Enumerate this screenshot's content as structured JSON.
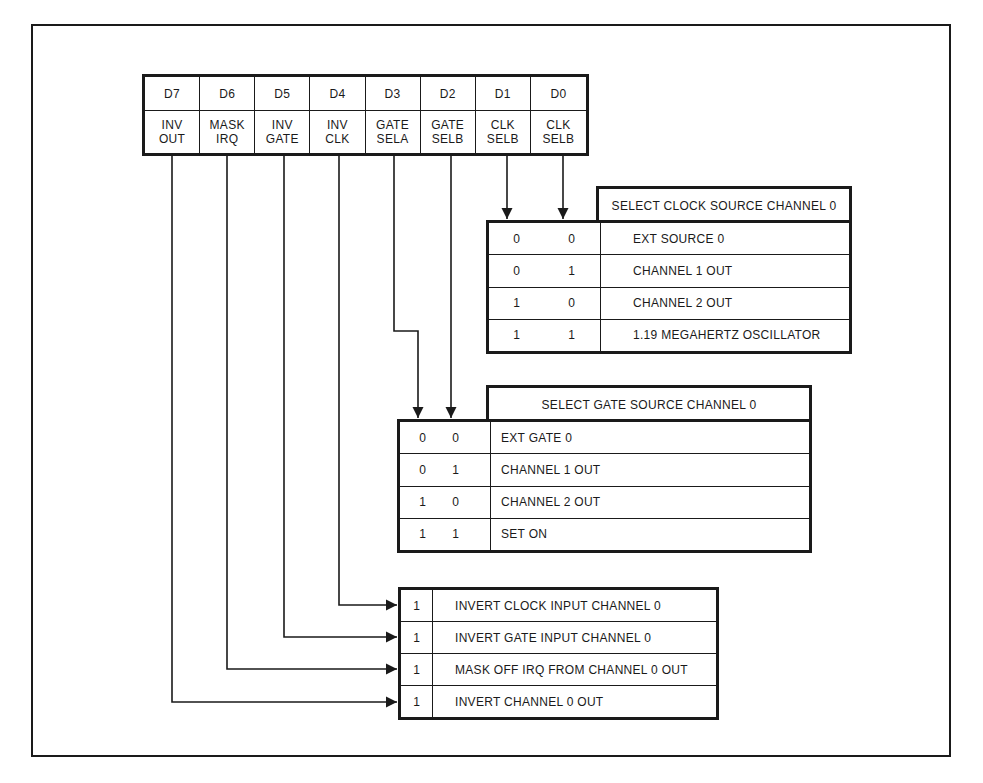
{
  "register": {
    "bits": [
      {
        "bit": "D7",
        "label_line1": "INV",
        "label_line2": "OUT"
      },
      {
        "bit": "D6",
        "label_line1": "MASK",
        "label_line2": "IRQ"
      },
      {
        "bit": "D5",
        "label_line1": "INV",
        "label_line2": "GATE"
      },
      {
        "bit": "D4",
        "label_line1": "INV",
        "label_line2": "CLK"
      },
      {
        "bit": "D3",
        "label_line1": "GATE",
        "label_line2": "SELA"
      },
      {
        "bit": "D2",
        "label_line1": "GATE",
        "label_line2": "SELB"
      },
      {
        "bit": "D1",
        "label_line1": "CLK",
        "label_line2": "SELB"
      },
      {
        "bit": "D0",
        "label_line1": "CLK",
        "label_line2": "SELB"
      }
    ]
  },
  "clock_table": {
    "title": "SELECT CLOCK SOURCE CHANNEL 0",
    "rows": [
      {
        "b1": "0",
        "b0": "0",
        "desc": "EXT SOURCE 0"
      },
      {
        "b1": "0",
        "b0": "1",
        "desc": "CHANNEL 1 OUT"
      },
      {
        "b1": "1",
        "b0": "0",
        "desc": "CHANNEL 2 OUT"
      },
      {
        "b1": "1",
        "b0": "1",
        "desc": "1.19 MEGAHERTZ OSCILLATOR"
      }
    ]
  },
  "gate_table": {
    "title": "SELECT GATE SOURCE CHANNEL 0",
    "rows": [
      {
        "b1": "0",
        "b0": "0",
        "desc": "EXT GATE 0"
      },
      {
        "b1": "0",
        "b0": "1",
        "desc": "CHANNEL 1 OUT"
      },
      {
        "b1": "1",
        "b0": "0",
        "desc": "CHANNEL 2 OUT"
      },
      {
        "b1": "1",
        "b0": "1",
        "desc": "SET ON"
      }
    ]
  },
  "invert_table": {
    "rows": [
      {
        "bit": "1",
        "desc": "INVERT CLOCK INPUT CHANNEL 0",
        "source": "D4"
      },
      {
        "bit": "1",
        "desc": "INVERT GATE INPUT CHANNEL 0",
        "source": "D5"
      },
      {
        "bit": "1",
        "desc": "MASK OFF IRQ FROM CHANNEL 0 OUT",
        "source": "D6"
      },
      {
        "bit": "1",
        "desc": "INVERT CHANNEL 0 OUT",
        "source": "D7"
      }
    ]
  },
  "colors": {
    "ink": "#1a1a1a",
    "paper": "#ffffff"
  }
}
